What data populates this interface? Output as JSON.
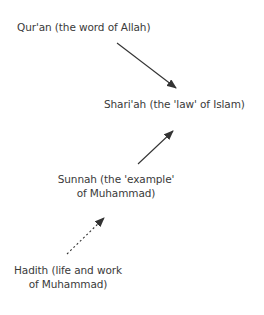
{
  "diagram": {
    "nodes": [
      {
        "id": "quran",
        "lines": [
          "Qur'an (the word of Allah)"
        ]
      },
      {
        "id": "shariah",
        "lines": [
          "Shari'ah (the 'law' of Islam)"
        ]
      },
      {
        "id": "sunnah",
        "lines": [
          "Sunnah (the 'example'",
          "of Muhammad)"
        ]
      },
      {
        "id": "hadith",
        "lines": [
          "Hadith (life and work",
          "of Muhammad)"
        ]
      }
    ],
    "edges": [
      {
        "from": "quran",
        "to": "shariah",
        "style": "solid"
      },
      {
        "from": "sunnah",
        "to": "shariah",
        "style": "solid"
      },
      {
        "from": "hadith",
        "to": "sunnah",
        "style": "dotted"
      }
    ],
    "colors": {
      "text": "#3a3a3a",
      "arrow": "#333333",
      "background": "#ffffff"
    }
  }
}
